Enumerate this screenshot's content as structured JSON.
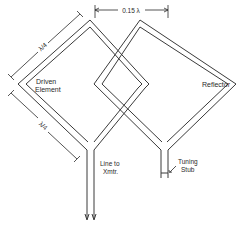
{
  "diagram": {
    "type": "quad antenna schematic (two-element)",
    "labels": {
      "driven_element_line1": "Driven",
      "driven_element_line2": "Element",
      "reflector": "Reflector",
      "spacing": "0.15 λ",
      "side_length_upper": "λ/4",
      "side_length_lower": "λ/4",
      "feed_line_line1": "Line to",
      "feed_line_line2": "Xmtr.",
      "tuning_stub_line1": "Tuning",
      "tuning_stub_line2": "Stub"
    },
    "colors": {
      "line": "#3a3a3a",
      "background": "#ffffff"
    }
  }
}
